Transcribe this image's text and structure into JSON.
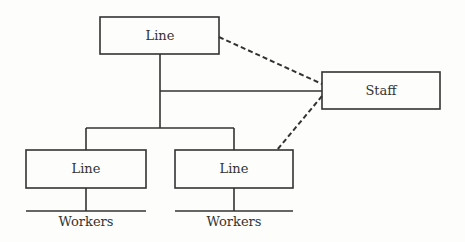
{
  "diagram": {
    "nodes": {
      "top_line": {
        "label": "Line"
      },
      "staff": {
        "label": "Staff"
      },
      "left_line": {
        "label": "Line"
      },
      "right_line": {
        "label": "Line"
      },
      "left_workers": {
        "label": "Workers"
      },
      "right_workers": {
        "label": "Workers"
      }
    },
    "edges": [
      {
        "from": "top_line",
        "to": "left_line",
        "style": "solid"
      },
      {
        "from": "top_line",
        "to": "right_line",
        "style": "solid"
      },
      {
        "from": "top_line",
        "to": "staff",
        "style": "solid"
      },
      {
        "from": "top_line",
        "to": "staff",
        "style": "dashed"
      },
      {
        "from": "staff",
        "to": "right_line",
        "style": "dashed"
      },
      {
        "from": "left_line",
        "to": "left_workers",
        "style": "solid"
      },
      {
        "from": "right_line",
        "to": "right_workers",
        "style": "solid"
      }
    ],
    "colors": {
      "stroke": "#333333",
      "background": "#fdfdfb"
    }
  }
}
